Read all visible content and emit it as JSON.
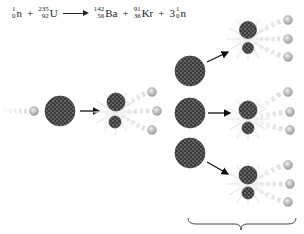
{
  "equation": {
    "reactant1": {
      "symbol": "n",
      "mass": "1",
      "atomic": "0",
      "coefficient": ""
    },
    "reactant2": {
      "symbol": "U",
      "mass": "235",
      "atomic": "92",
      "coefficient": ""
    },
    "product1": {
      "symbol": "Ba",
      "mass": "142",
      "atomic": "56",
      "coefficient": ""
    },
    "product2": {
      "symbol": "Kr",
      "mass": "91",
      "atomic": "36",
      "coefficient": ""
    },
    "product3": {
      "symbol": "n",
      "mass": "1",
      "atomic": "0",
      "coefficient": "3"
    },
    "plus": "+",
    "arrow": "reaction-arrow"
  },
  "colors": {
    "nucleus": "#3a3a3a",
    "nucleus_texture": "#777777",
    "neutron": "#c8c8c8",
    "neutron_edge": "#9a9a9a",
    "arrow": "#111111",
    "burst": "#e4e4e4"
  },
  "diagram": {
    "incoming_neutron": {
      "cx": 34,
      "cy": 111,
      "r": 4.5
    },
    "uranium_nucleus": {
      "cx": 60,
      "cy": 111,
      "r": 15
    },
    "fission_events": [
      {
        "large": {
          "cx": 116,
          "cy": 102,
          "r": 9
        },
        "small": {
          "cx": 115,
          "cy": 122,
          "r": 6
        },
        "neutrons": [
          {
            "cx": 152,
            "cy": 92
          },
          {
            "cx": 157,
            "cy": 111
          },
          {
            "cx": 152,
            "cy": 130
          }
        ]
      },
      {
        "large": {
          "cx": 248,
          "cy": 30,
          "r": 8.5
        },
        "small": {
          "cx": 248,
          "cy": 48,
          "r": 5.5
        },
        "neutrons": [
          {
            "cx": 288,
            "cy": 20
          },
          {
            "cx": 288,
            "cy": 39
          },
          {
            "cx": 288,
            "cy": 57
          }
        ]
      },
      {
        "large": {
          "cx": 248,
          "cy": 110,
          "r": 9
        },
        "small": {
          "cx": 248,
          "cy": 128,
          "r": 6
        },
        "neutrons": [
          {
            "cx": 288,
            "cy": 92
          },
          {
            "cx": 290,
            "cy": 112
          },
          {
            "cx": 290,
            "cy": 130
          }
        ]
      },
      {
        "large": {
          "cx": 248,
          "cy": 175,
          "r": 9
        },
        "small": {
          "cx": 248,
          "cy": 193,
          "r": 6
        },
        "neutrons": [
          {
            "cx": 288,
            "cy": 165
          },
          {
            "cx": 290,
            "cy": 184
          },
          {
            "cx": 288,
            "cy": 202
          }
        ]
      }
    ],
    "secondary_nuclei": [
      {
        "cx": 190,
        "cy": 71,
        "r": 15
      },
      {
        "cx": 190,
        "cy": 113,
        "r": 15
      },
      {
        "cx": 190,
        "cy": 153,
        "r": 15
      }
    ],
    "brace": {
      "x1": 188,
      "x2": 296,
      "y": 218,
      "tip_x": 241
    }
  }
}
